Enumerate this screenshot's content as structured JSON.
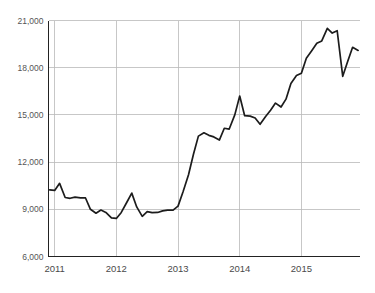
{
  "chart_data": {
    "type": "line",
    "title": "",
    "subtitle": "",
    "xlabel": "",
    "ylabel": "",
    "xlim": [
      2010.9,
      2015.95
    ],
    "ylim": [
      6000,
      21000
    ],
    "grid": true,
    "legend": false,
    "legend_position": "none",
    "line_color": "#1c1c1c",
    "grid_color": "#b9b9b9",
    "axis_color": "#222222",
    "label_color": "#555555",
    "y_ticks": [
      6000,
      9000,
      12000,
      15000,
      18000,
      21000
    ],
    "y_tick_labels": [
      "6,000",
      "9,000",
      "12,000",
      "15,000",
      "18,000",
      "21,000"
    ],
    "x_ticks": [
      2011,
      2012,
      2013,
      2014,
      2015
    ],
    "x_tick_labels": [
      "2011",
      "2012",
      "2013",
      "2014",
      "2015"
    ],
    "series": [
      {
        "name": "series-1",
        "x": [
          2010.92,
          2011.0,
          2011.08,
          2011.17,
          2011.25,
          2011.33,
          2011.42,
          2011.5,
          2011.58,
          2011.67,
          2011.75,
          2011.83,
          2011.92,
          2012.0,
          2012.08,
          2012.17,
          2012.25,
          2012.33,
          2012.42,
          2012.5,
          2012.58,
          2012.67,
          2012.75,
          2012.83,
          2012.92,
          2013.0,
          2013.08,
          2013.17,
          2013.25,
          2013.33,
          2013.42,
          2013.5,
          2013.58,
          2013.67,
          2013.75,
          2013.83,
          2013.92,
          2014.0,
          2014.08,
          2014.17,
          2014.25,
          2014.33,
          2014.42,
          2014.5,
          2014.58,
          2014.67,
          2014.75,
          2014.83,
          2014.92,
          2015.0,
          2015.08,
          2015.17,
          2015.25,
          2015.33,
          2015.42,
          2015.5,
          2015.58,
          2015.67,
          2015.75,
          2015.83,
          2015.92
        ],
        "values": [
          10230,
          10200,
          10650,
          9750,
          9700,
          9770,
          9730,
          9720,
          9000,
          8750,
          8950,
          8800,
          8450,
          8420,
          8800,
          9450,
          10030,
          9150,
          8550,
          8850,
          8790,
          8800,
          8900,
          8950,
          8950,
          9200,
          10100,
          11200,
          12500,
          13650,
          13860,
          13700,
          13600,
          13400,
          14150,
          14100,
          15000,
          16200,
          14950,
          14920,
          14800,
          14400,
          14900,
          15300,
          15750,
          15500,
          16000,
          17000,
          17500,
          17650,
          18600,
          19100,
          19550,
          19700,
          20500,
          20200,
          20350,
          17450,
          18400,
          19300,
          19100
        ]
      }
    ]
  }
}
